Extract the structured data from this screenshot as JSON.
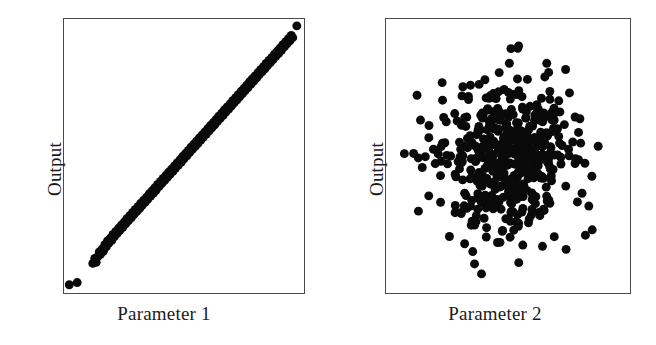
{
  "figure": {
    "background_color": "#ffffff",
    "marker_color": "#0a0a0a",
    "frame_color": "#4a4a4a"
  },
  "chart_data": [
    {
      "type": "scatter",
      "title": "",
      "xlabel": "Parameter 1",
      "ylabel": "Output",
      "xlim": [
        0,
        1
      ],
      "ylim": [
        0,
        1
      ],
      "grid": false,
      "legend": "none",
      "marker_size_px": 9,
      "description": "Strong positive linear correlation between Parameter 1 and Output",
      "points": [
        [
          0.022,
          0.03
        ],
        [
          0.055,
          0.038
        ],
        [
          0.12,
          0.108
        ],
        [
          0.128,
          0.126
        ],
        [
          0.134,
          0.112
        ],
        [
          0.141,
          0.133
        ],
        [
          0.147,
          0.15
        ],
        [
          0.152,
          0.141
        ],
        [
          0.158,
          0.16
        ],
        [
          0.164,
          0.152
        ],
        [
          0.17,
          0.176
        ],
        [
          0.176,
          0.168
        ],
        [
          0.181,
          0.19
        ],
        [
          0.187,
          0.182
        ],
        [
          0.193,
          0.2
        ],
        [
          0.199,
          0.192
        ],
        [
          0.204,
          0.214
        ],
        [
          0.21,
          0.206
        ],
        [
          0.216,
          0.225
        ],
        [
          0.222,
          0.218
        ],
        [
          0.228,
          0.237
        ],
        [
          0.233,
          0.229
        ],
        [
          0.239,
          0.248
        ],
        [
          0.245,
          0.24
        ],
        [
          0.251,
          0.259
        ],
        [
          0.257,
          0.252
        ],
        [
          0.262,
          0.271
        ],
        [
          0.268,
          0.263
        ],
        [
          0.274,
          0.282
        ],
        [
          0.28,
          0.274
        ],
        [
          0.286,
          0.294
        ],
        [
          0.291,
          0.286
        ],
        [
          0.297,
          0.305
        ],
        [
          0.303,
          0.297
        ],
        [
          0.309,
          0.316
        ],
        [
          0.315,
          0.308
        ],
        [
          0.32,
          0.328
        ],
        [
          0.326,
          0.32
        ],
        [
          0.332,
          0.339
        ],
        [
          0.338,
          0.331
        ],
        [
          0.344,
          0.35
        ],
        [
          0.349,
          0.342
        ],
        [
          0.355,
          0.362
        ],
        [
          0.361,
          0.354
        ],
        [
          0.367,
          0.373
        ],
        [
          0.373,
          0.365
        ],
        [
          0.378,
          0.384
        ],
        [
          0.384,
          0.376
        ],
        [
          0.39,
          0.396
        ],
        [
          0.396,
          0.388
        ],
        [
          0.402,
          0.407
        ],
        [
          0.407,
          0.399
        ],
        [
          0.413,
          0.418
        ],
        [
          0.419,
          0.41
        ],
        [
          0.425,
          0.43
        ],
        [
          0.431,
          0.422
        ],
        [
          0.436,
          0.441
        ],
        [
          0.442,
          0.433
        ],
        [
          0.448,
          0.452
        ],
        [
          0.454,
          0.444
        ],
        [
          0.46,
          0.464
        ],
        [
          0.465,
          0.456
        ],
        [
          0.471,
          0.475
        ],
        [
          0.477,
          0.467
        ],
        [
          0.483,
          0.486
        ],
        [
          0.489,
          0.478
        ],
        [
          0.494,
          0.498
        ],
        [
          0.5,
          0.49
        ],
        [
          0.506,
          0.509
        ],
        [
          0.512,
          0.501
        ],
        [
          0.518,
          0.52
        ],
        [
          0.523,
          0.512
        ],
        [
          0.529,
          0.532
        ],
        [
          0.535,
          0.524
        ],
        [
          0.541,
          0.543
        ],
        [
          0.547,
          0.535
        ],
        [
          0.552,
          0.554
        ],
        [
          0.558,
          0.546
        ],
        [
          0.564,
          0.566
        ],
        [
          0.57,
          0.558
        ],
        [
          0.576,
          0.577
        ],
        [
          0.581,
          0.569
        ],
        [
          0.587,
          0.588
        ],
        [
          0.593,
          0.58
        ],
        [
          0.599,
          0.6
        ],
        [
          0.605,
          0.592
        ],
        [
          0.61,
          0.611
        ],
        [
          0.616,
          0.603
        ],
        [
          0.622,
          0.622
        ],
        [
          0.628,
          0.614
        ],
        [
          0.634,
          0.634
        ],
        [
          0.639,
          0.626
        ],
        [
          0.645,
          0.645
        ],
        [
          0.651,
          0.637
        ],
        [
          0.657,
          0.656
        ],
        [
          0.663,
          0.648
        ],
        [
          0.668,
          0.668
        ],
        [
          0.674,
          0.66
        ],
        [
          0.68,
          0.679
        ],
        [
          0.686,
          0.671
        ],
        [
          0.692,
          0.69
        ],
        [
          0.697,
          0.682
        ],
        [
          0.703,
          0.702
        ],
        [
          0.709,
          0.694
        ],
        [
          0.715,
          0.713
        ],
        [
          0.721,
          0.705
        ],
        [
          0.726,
          0.724
        ],
        [
          0.732,
          0.716
        ],
        [
          0.738,
          0.736
        ],
        [
          0.744,
          0.728
        ],
        [
          0.75,
          0.747
        ],
        [
          0.755,
          0.739
        ],
        [
          0.761,
          0.758
        ],
        [
          0.767,
          0.75
        ],
        [
          0.773,
          0.77
        ],
        [
          0.779,
          0.762
        ],
        [
          0.784,
          0.781
        ],
        [
          0.79,
          0.773
        ],
        [
          0.796,
          0.792
        ],
        [
          0.802,
          0.784
        ],
        [
          0.808,
          0.804
        ],
        [
          0.813,
          0.796
        ],
        [
          0.819,
          0.815
        ],
        [
          0.825,
          0.807
        ],
        [
          0.831,
          0.826
        ],
        [
          0.837,
          0.818
        ],
        [
          0.842,
          0.838
        ],
        [
          0.848,
          0.83
        ],
        [
          0.854,
          0.849
        ],
        [
          0.86,
          0.841
        ],
        [
          0.866,
          0.86
        ],
        [
          0.871,
          0.852
        ],
        [
          0.877,
          0.872
        ],
        [
          0.883,
          0.864
        ],
        [
          0.889,
          0.883
        ],
        [
          0.895,
          0.875
        ],
        [
          0.9,
          0.894
        ],
        [
          0.906,
          0.886
        ],
        [
          0.912,
          0.906
        ],
        [
          0.918,
          0.898
        ],
        [
          0.924,
          0.917
        ],
        [
          0.929,
          0.909
        ],
        [
          0.935,
          0.928
        ],
        [
          0.941,
          0.92
        ],
        [
          0.947,
          0.94
        ],
        [
          0.953,
          0.932
        ],
        [
          0.97,
          0.975
        ]
      ]
    },
    {
      "type": "scatter",
      "title": "",
      "xlabel": "Parameter 2",
      "ylabel": "Output",
      "xlim": [
        0,
        1
      ],
      "ylim": [
        0,
        1
      ],
      "grid": false,
      "legend": "none",
      "marker_size_px": 9,
      "description": "No correlation between Parameter 2 and Output; isotropic Gaussian cloud centred near (0.5, 0.5)",
      "distribution": {
        "shape": "gaussian_cloud",
        "center": [
          0.5,
          0.5
        ],
        "sigma": [
          0.135,
          0.135
        ],
        "n_points": 520,
        "seed": 1234
      }
    }
  ],
  "labels": {
    "left_xlabel": "Parameter 1",
    "left_ylabel": "Output",
    "right_xlabel": "Parameter 2",
    "right_ylabel": "Output"
  }
}
